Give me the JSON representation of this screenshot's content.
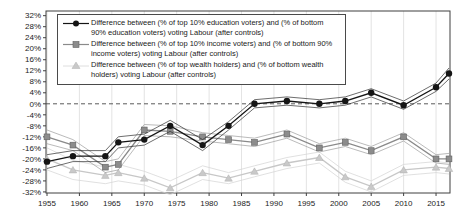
{
  "chart_data": {
    "type": "line",
    "title": "",
    "xlabel": "",
    "ylabel": "",
    "xlim": [
      1955,
      2017
    ],
    "ylim": [
      -32,
      32
    ],
    "grid": "vertical-only",
    "zero_line": "dashed",
    "legend_position": "top-left-boxed",
    "x_tick_labels": [
      "1955",
      "1960",
      "1965",
      "1970",
      "1975",
      "1980",
      "1985",
      "1990",
      "1995",
      "2000",
      "2005",
      "2010",
      "2015"
    ],
    "y_tick_labels": [
      "32%",
      "28%",
      "24%",
      "20%",
      "16%",
      "12%",
      "8%",
      "4%",
      "0%",
      "-4%",
      "-8%",
      "-12%",
      "-16%",
      "-20%",
      "-24%",
      "-28%",
      "-32%"
    ],
    "x": [
      1955,
      1959,
      1964,
      1966,
      1970,
      1974,
      1979,
      1983,
      1987,
      1992,
      1997,
      2001,
      2005,
      2010,
      2015,
      2017
    ],
    "series": [
      {
        "id": "education",
        "label": "Difference between (% of top 10% education voters) and (% of bottom 90% education voters) voting Labour (after controls)",
        "marker": "circle",
        "color": "#151515",
        "band_color": "#2e2e2e",
        "values": [
          -21,
          -19,
          -19,
          -14,
          -13,
          -8,
          -15,
          -8,
          0,
          1,
          0,
          1,
          4,
          -0.5,
          6,
          11
        ],
        "band_halfwidth": [
          2.5,
          2,
          2,
          2,
          2,
          2,
          2,
          1.5,
          1.5,
          1.5,
          1.5,
          1.5,
          1.5,
          1.5,
          1.5,
          2
        ]
      },
      {
        "id": "income",
        "label": "Difference between (% of top 10% income voters) and (% of bottom 90% income voters) voting Labour (after controls)",
        "marker": "square",
        "color": "#8a8a8a",
        "band_color": "#9c9c9c",
        "values": [
          -12,
          -15,
          -23,
          -22,
          -9.5,
          -10,
          -12,
          -13,
          -14,
          -11,
          -16,
          -14,
          -17,
          -12,
          -20,
          -20
        ],
        "band_halfwidth": [
          2.5,
          2,
          2,
          2,
          2,
          2,
          1.5,
          1.5,
          1.5,
          1.5,
          1.5,
          1.5,
          1.5,
          1.5,
          1.5,
          2
        ]
      },
      {
        "id": "wealth",
        "label": "Difference between (% of top wealth holders) and (% of bottom wealth holders) voting Labour (after controls)",
        "marker": "triangle",
        "color": "#c7c7c7",
        "band_color": "#d2d2d2",
        "values": [
          -20,
          -24,
          -26,
          -25,
          -27,
          -30.5,
          -25,
          -27,
          -24.5,
          -21.5,
          -19.5,
          -26.5,
          -30,
          -24,
          -23,
          -23.5
        ],
        "band_halfwidth": [
          4,
          3.5,
          3,
          3,
          2.5,
          2.5,
          2.5,
          2,
          2,
          2,
          2,
          2,
          2,
          2,
          2,
          2
        ]
      }
    ]
  }
}
